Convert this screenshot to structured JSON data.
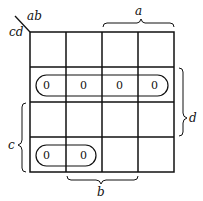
{
  "kmap": {
    "row_var_label": "cd",
    "col_var_label": "ab",
    "brackets": {
      "a": "a",
      "b": "b",
      "c": "c",
      "d": "d"
    },
    "cells": [
      [
        "",
        "",
        "",
        ""
      ],
      [
        "0",
        "0",
        "0",
        "0"
      ],
      [
        "",
        "",
        "",
        ""
      ],
      [
        "0",
        "0",
        "",
        ""
      ]
    ],
    "groups": [
      {
        "name": "row-2-group",
        "row": 1,
        "col_start": 0,
        "col_end": 3
      },
      {
        "name": "row-4-group",
        "row": 3,
        "col_start": 0,
        "col_end": 1
      }
    ]
  }
}
